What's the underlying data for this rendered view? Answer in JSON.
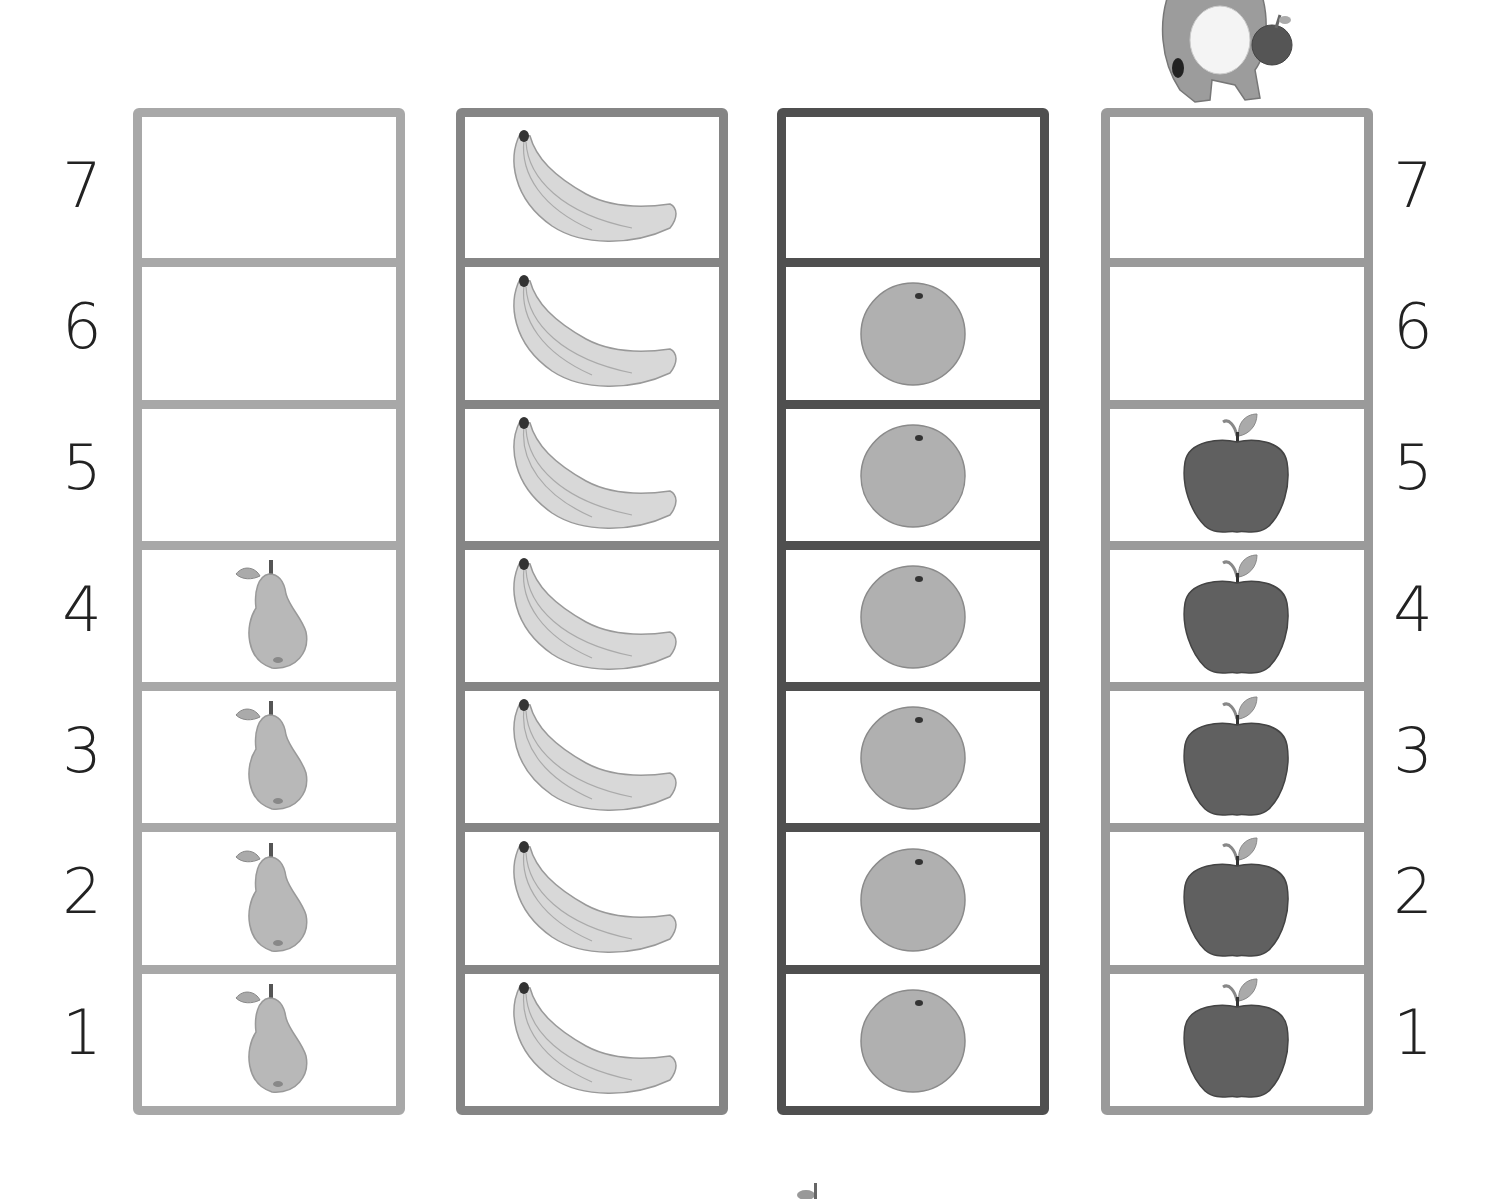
{
  "chart_data": {
    "type": "pictograph",
    "title": "",
    "xlabel": "",
    "ylabel": "",
    "categories": [
      "Pear",
      "Banana",
      "Orange",
      "Apple"
    ],
    "values": [
      4,
      7,
      6,
      5
    ],
    "ylim": [
      0,
      7
    ],
    "y_ticks": [
      "1",
      "2",
      "3",
      "4",
      "5",
      "6",
      "7"
    ],
    "grid": true,
    "legend": "none"
  },
  "axis": {
    "left_numbers": [
      "7",
      "6",
      "5",
      "4",
      "3",
      "2",
      "1"
    ],
    "right_numbers": [
      "7",
      "6",
      "5",
      "4",
      "3",
      "2",
      "1"
    ]
  },
  "columns": [
    {
      "fruit": "pear",
      "count": 4,
      "border_color": "#a8a8a8"
    },
    {
      "fruit": "banana",
      "count": 7,
      "border_color": "#858585"
    },
    {
      "fruit": "orange",
      "count": 6,
      "border_color": "#4f4f4f"
    },
    {
      "fruit": "apple",
      "count": 5,
      "border_color": "#9a9a9a"
    }
  ],
  "colors": {
    "pear": "#b8b8b8",
    "banana": "#d8d8d8",
    "orange": "#b0b0b0",
    "apple": "#606060",
    "number_text": "#222222"
  }
}
